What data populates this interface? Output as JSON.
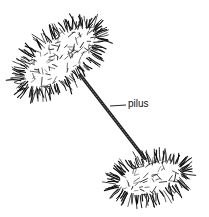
{
  "diagram": {
    "labels": [
      {
        "id": "pilus",
        "text": "pilus"
      }
    ],
    "colors": {
      "ink": "#111111",
      "background": "#ffffff"
    },
    "elements": [
      {
        "name": "donor-bacterium",
        "description": "hairy elongated cell, upper left"
      },
      {
        "name": "pilus",
        "description": "sex pilus bridge connecting the two cells"
      },
      {
        "name": "recipient-bacterium",
        "description": "hairy elongated cell, lower right"
      }
    ]
  }
}
